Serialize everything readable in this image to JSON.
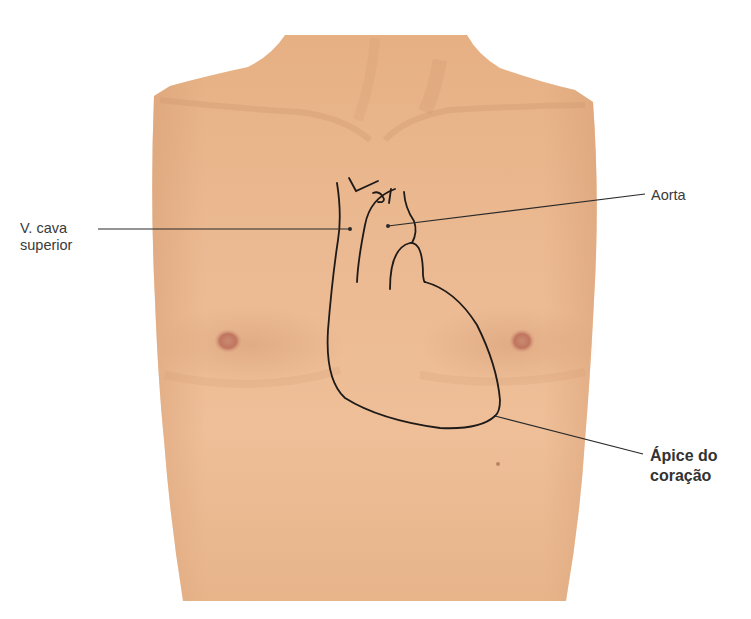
{
  "figure": {
    "colors": {
      "skin_base": "#e8b68c",
      "skin_light": "#efc39d",
      "skin_shadow": "#d9a077",
      "nipple": "#c47a62",
      "outline": "#1e1a18",
      "leader_line": "#2a2a2a",
      "label_text": "#3a3a3a",
      "background": "#ffffff"
    }
  },
  "labels": {
    "vena_cava": {
      "line1": "V. cava",
      "line2": "superior"
    },
    "aorta": {
      "text": "Aorta"
    },
    "apex": {
      "line1": "Ápice do",
      "line2": "coração"
    }
  }
}
